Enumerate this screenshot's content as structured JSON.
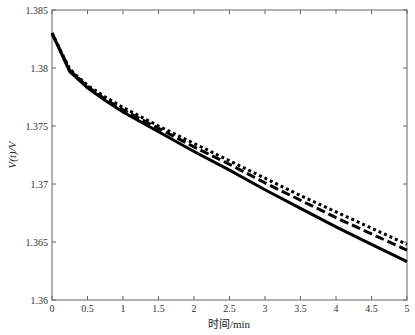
{
  "chart_data": {
    "type": "line",
    "title": "",
    "xlabel": "时间/min",
    "ylabel": "V(t)/V",
    "xlim": [
      0,
      5
    ],
    "ylim": [
      1.36,
      1.385
    ],
    "xticks": [
      "0",
      "0.5",
      "1",
      "1.5",
      "2",
      "2.5",
      "3",
      "3.5",
      "4",
      "4.5",
      "5"
    ],
    "yticks": [
      "1.36",
      "1.365",
      "1.37",
      "1.375",
      "1.38",
      "1.385"
    ],
    "grid": false,
    "legend": "none",
    "x": [
      0,
      0.25,
      0.5,
      0.75,
      1,
      1.5,
      2,
      2.5,
      3,
      3.5,
      4,
      4.5,
      5
    ],
    "series": [
      {
        "name": "solid",
        "style": "solid",
        "values": [
          1.383,
          1.3797,
          1.3783,
          1.3772,
          1.3762,
          1.3745,
          1.3728,
          1.3712,
          1.3695,
          1.3679,
          1.3663,
          1.3648,
          1.3633
        ]
      },
      {
        "name": "dashed",
        "style": "dashed",
        "values": [
          1.383,
          1.3798,
          1.3784,
          1.3773,
          1.3764,
          1.3748,
          1.3732,
          1.3717,
          1.3701,
          1.3686,
          1.3671,
          1.3657,
          1.3643
        ]
      },
      {
        "name": "dotted",
        "style": "dotted",
        "values": [
          1.383,
          1.3799,
          1.3785,
          1.3775,
          1.3766,
          1.375,
          1.3735,
          1.372,
          1.3705,
          1.369,
          1.3676,
          1.3662,
          1.3648
        ]
      }
    ]
  }
}
